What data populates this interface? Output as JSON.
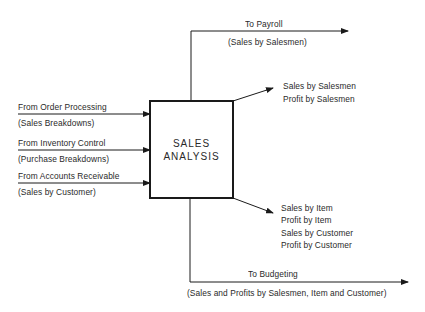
{
  "diagram": {
    "center_box": {
      "line1": "SALES",
      "line2": "ANALYSIS"
    },
    "inputs": [
      {
        "source": "From Order Processing",
        "content": "(Sales Breakdowns)"
      },
      {
        "source": "From Inventory Control",
        "content": "(Purchase Breakdowns)"
      },
      {
        "source": "From Accounts Receivable",
        "content": "(Sales by Customer)"
      }
    ],
    "outputs": {
      "payroll": {
        "destination": "To Payroll",
        "content": "(Sales by Salesmen)"
      },
      "salesmen_reports": [
        "Sales by Salesmen",
        "Profit by Salesmen"
      ],
      "item_customer_reports": [
        "Sales by Item",
        "Profit by Item",
        "Sales by Customer",
        "Profit by Customer"
      ],
      "budgeting": {
        "destination": "To Budgeting",
        "content": "(Sales and Profits by Salesmen, Item and Customer)"
      }
    },
    "colors": {
      "line": "#1a1a1a",
      "text": "#2a2a2a",
      "background": "#ffffff"
    }
  }
}
